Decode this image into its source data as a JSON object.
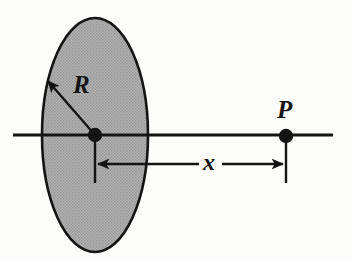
{
  "figure": {
    "background_color": "#fdfdfb",
    "stroke_color": "#141414",
    "disk_fill_color": "#a8a8a8",
    "width": 353,
    "height": 261
  },
  "labels": {
    "radius": "R",
    "point": "P",
    "distance": "x"
  },
  "icons": {
    "disk": "shaded-ellipse-icon",
    "center_point": "filled-dot-icon",
    "field_point": "filled-dot-icon",
    "radius_arrow": "single-arrow-icon",
    "distance_arrow": "double-arrow-icon",
    "axis": "horizontal-line-icon"
  },
  "geometry": {
    "disk": {
      "cx": 95,
      "cy": 135,
      "rx": 53,
      "ry": 117
    },
    "axis_line": {
      "x1": 13,
      "y1": 135,
      "x2": 333,
      "y2": 135
    },
    "center_dot": {
      "cx": 95,
      "cy": 135,
      "r": 7
    },
    "field_point_dot": {
      "cx": 286,
      "cy": 136,
      "r": 7
    },
    "radius_arrow": {
      "x1": 95,
      "y1": 135,
      "x2": 46,
      "y2": 79
    },
    "dimension_line": {
      "y": 164,
      "x_start": 95,
      "x_end": 286
    },
    "center_tick": {
      "x": 95,
      "y1": 135,
      "y2": 183
    },
    "field_point_tick": {
      "x": 286,
      "y1": 136,
      "y2": 183
    }
  }
}
